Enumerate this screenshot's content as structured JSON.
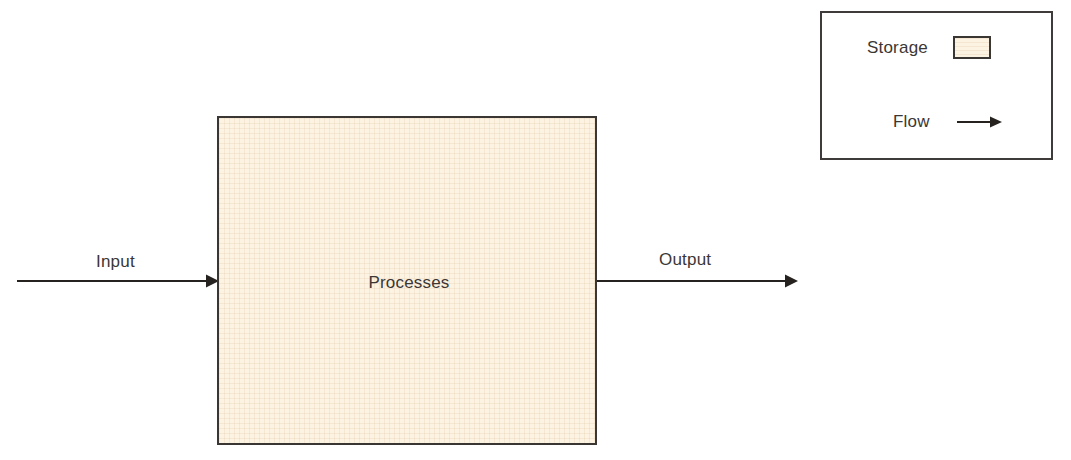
{
  "diagram": {
    "background_color": "#ffffff",
    "line_color": "#262220",
    "border_color": "#3a3634",
    "text_color": "#3b3735",
    "storage_fill_color": "#fdf3e3"
  },
  "process": {
    "label": "Processes"
  },
  "flows": {
    "input": {
      "label": "Input",
      "icon": "arrow-right-icon"
    },
    "output": {
      "label": "Output",
      "icon": "arrow-right-icon"
    }
  },
  "legend": {
    "items": [
      {
        "label": "Storage",
        "symbol": "filled-rectangle-swatch",
        "color": "#fdf3e3"
      },
      {
        "label": "Flow",
        "symbol": "arrow-right-icon",
        "color": "#262220"
      }
    ]
  }
}
